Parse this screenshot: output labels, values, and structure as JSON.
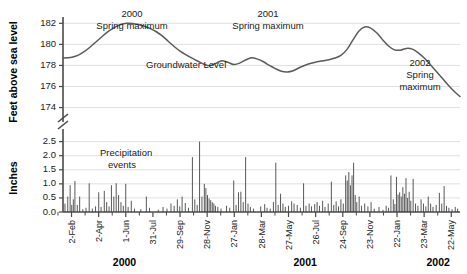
{
  "chart_data": {
    "type": "line",
    "title": "",
    "panels": [
      {
        "name": "groundwater",
        "type": "line",
        "ylabel": "Feet above sea level",
        "ylim": [
          173.2,
          182.6
        ],
        "yticks": [
          174,
          176,
          178,
          180,
          182
        ],
        "ytick_labels": [
          "174",
          "176",
          "178",
          "180",
          "182"
        ],
        "axis_break": true,
        "grid": true,
        "series_label": "Groundwater Level",
        "series": [
          {
            "name": "Groundwater Level",
            "color": "#5b5b5b",
            "x": [
              0,
              0.012,
              0.025,
              0.04,
              0.055,
              0.07,
              0.085,
              0.1,
              0.115,
              0.13,
              0.145,
              0.16,
              0.175,
              0.19,
              0.205,
              0.22,
              0.235,
              0.25,
              0.265,
              0.28,
              0.295,
              0.31,
              0.325,
              0.34,
              0.355,
              0.37,
              0.385,
              0.4,
              0.415,
              0.43,
              0.445,
              0.46,
              0.475,
              0.49,
              0.505,
              0.52,
              0.535,
              0.55,
              0.565,
              0.58,
              0.595,
              0.61,
              0.625,
              0.64,
              0.655,
              0.67,
              0.685,
              0.7,
              0.715,
              0.73,
              0.745,
              0.76,
              0.775,
              0.79,
              0.805,
              0.82,
              0.835,
              0.85,
              0.865,
              0.88,
              0.895,
              0.91,
              0.925,
              0.94,
              0.955,
              0.97,
              0.985,
              1.0
            ],
            "y": [
              178.7,
              178.72,
              178.8,
              179.0,
              179.35,
              179.8,
              180.3,
              180.8,
              181.25,
              181.62,
              181.88,
              182.0,
              181.98,
              181.88,
              181.72,
              181.5,
              181.2,
              180.8,
              180.3,
              179.8,
              179.35,
              179.0,
              178.7,
              178.4,
              178.12,
              177.98,
              178.2,
              178.45,
              178.3,
              178.1,
              178.22,
              178.52,
              178.72,
              178.6,
              178.35,
              178.0,
              177.7,
              177.45,
              177.38,
              177.5,
              177.78,
              178.02,
              178.2,
              178.35,
              178.45,
              178.55,
              178.7,
              178.95,
              179.5,
              180.4,
              181.25,
              181.65,
              181.55,
              181.1,
              180.45,
              179.85,
              179.48,
              179.45,
              179.62,
              179.55,
              179.2,
              178.7,
              178.1,
              177.45,
              176.8,
              176.15,
              175.55,
              175.05
            ]
          }
        ],
        "annotations": [
          {
            "text_lines": [
              "2000",
              "Spring maximum"
            ],
            "x": 0.155,
            "note": "2000 Spring maximum"
          },
          {
            "text_lines": [
              "2001",
              "Spring maximum"
            ],
            "x": 0.555,
            "note": "2001 Spring maximum"
          },
          {
            "text_lines": [
              "2002",
              "Spring",
              "maximum"
            ],
            "x": 0.895,
            "note": "2002 Spring maximum"
          }
        ]
      },
      {
        "name": "precipitation",
        "type": "bar",
        "ylabel": "Inches",
        "ylim": [
          0,
          2.7
        ],
        "yticks": [
          0.0,
          0.5,
          1.0,
          1.5,
          2.0,
          2.5
        ],
        "ytick_labels": [
          "0.0",
          "0.5",
          "1.0",
          "1.5",
          "2.0",
          "2.5"
        ],
        "grid": true,
        "series_label": "Precipitation events",
        "bar_color": "#3a3a3a",
        "values": [
          [
            0.005,
            0.3
          ],
          [
            0.012,
            0.55
          ],
          [
            0.018,
            0.95
          ],
          [
            0.022,
            0.25
          ],
          [
            0.026,
            0.45
          ],
          [
            0.03,
            1.1
          ],
          [
            0.036,
            0.25
          ],
          [
            0.042,
            0.55
          ],
          [
            0.05,
            0.1
          ],
          [
            0.058,
            0.15
          ],
          [
            0.066,
            1.02
          ],
          [
            0.074,
            0.12
          ],
          [
            0.082,
            0.2
          ],
          [
            0.09,
            0.7
          ],
          [
            0.096,
            0.18
          ],
          [
            0.104,
            0.75
          ],
          [
            0.11,
            0.35
          ],
          [
            0.116,
            0.2
          ],
          [
            0.122,
            0.95
          ],
          [
            0.128,
            0.55
          ],
          [
            0.134,
            1.02
          ],
          [
            0.14,
            0.6
          ],
          [
            0.146,
            0.35
          ],
          [
            0.152,
            0.22
          ],
          [
            0.158,
            1.0
          ],
          [
            0.164,
            0.18
          ],
          [
            0.172,
            0.4
          ],
          [
            0.18,
            0.12
          ],
          [
            0.196,
            0.1
          ],
          [
            0.21,
            0.55
          ],
          [
            0.218,
            0.15
          ],
          [
            0.24,
            0.08
          ],
          [
            0.252,
            0.18
          ],
          [
            0.262,
            0.12
          ],
          [
            0.272,
            0.3
          ],
          [
            0.28,
            0.22
          ],
          [
            0.288,
            0.45
          ],
          [
            0.294,
            0.2
          ],
          [
            0.3,
            0.55
          ],
          [
            0.308,
            0.32
          ],
          [
            0.316,
            0.15
          ],
          [
            0.326,
            1.95
          ],
          [
            0.332,
            0.45
          ],
          [
            0.338,
            0.25
          ],
          [
            0.344,
            2.5
          ],
          [
            0.35,
            0.55
          ],
          [
            0.356,
            1.0
          ],
          [
            0.36,
            0.85
          ],
          [
            0.364,
            0.6
          ],
          [
            0.368,
            0.48
          ],
          [
            0.372,
            0.42
          ],
          [
            0.376,
            0.35
          ],
          [
            0.38,
            0.3
          ],
          [
            0.384,
            0.22
          ],
          [
            0.39,
            0.18
          ],
          [
            0.398,
            0.12
          ],
          [
            0.412,
            0.22
          ],
          [
            0.42,
            0.15
          ],
          [
            0.43,
            1.12
          ],
          [
            0.436,
            0.25
          ],
          [
            0.442,
            0.7
          ],
          [
            0.448,
            0.72
          ],
          [
            0.454,
            0.35
          ],
          [
            0.46,
            1.95
          ],
          [
            0.466,
            0.3
          ],
          [
            0.472,
            0.18
          ],
          [
            0.48,
            0.12
          ],
          [
            0.498,
            0.2
          ],
          [
            0.508,
            0.28
          ],
          [
            0.514,
            0.15
          ],
          [
            0.522,
            0.12
          ],
          [
            0.53,
            0.35
          ],
          [
            0.536,
            1.75
          ],
          [
            0.542,
            0.25
          ],
          [
            0.548,
            0.65
          ],
          [
            0.554,
            0.3
          ],
          [
            0.56,
            0.18
          ],
          [
            0.568,
            0.22
          ],
          [
            0.576,
            0.38
          ],
          [
            0.582,
            0.3
          ],
          [
            0.59,
            0.25
          ],
          [
            0.598,
            0.15
          ],
          [
            0.606,
            1.02
          ],
          [
            0.612,
            0.22
          ],
          [
            0.62,
            0.3
          ],
          [
            0.626,
            0.2
          ],
          [
            0.634,
            0.28
          ],
          [
            0.64,
            0.35
          ],
          [
            0.646,
            0.22
          ],
          [
            0.654,
            0.4
          ],
          [
            0.66,
            0.18
          ],
          [
            0.668,
            0.3
          ],
          [
            0.676,
            1.08
          ],
          [
            0.682,
            0.25
          ],
          [
            0.688,
            0.38
          ],
          [
            0.694,
            0.2
          ],
          [
            0.7,
            0.45
          ],
          [
            0.706,
            0.3
          ],
          [
            0.712,
            1.3
          ],
          [
            0.716,
            1.12
          ],
          [
            0.72,
            1.42
          ],
          [
            0.724,
            0.95
          ],
          [
            0.728,
            1.3
          ],
          [
            0.732,
            1.75
          ],
          [
            0.736,
            0.6
          ],
          [
            0.74,
            0.35
          ],
          [
            0.746,
            0.55
          ],
          [
            0.752,
            0.22
          ],
          [
            0.76,
            0.3
          ],
          [
            0.768,
            0.2
          ],
          [
            0.776,
            0.35
          ],
          [
            0.784,
            0.12
          ],
          [
            0.796,
            0.18
          ],
          [
            0.806,
            0.08
          ],
          [
            0.814,
            0.22
          ],
          [
            0.82,
            0.15
          ],
          [
            0.826,
            1.3
          ],
          [
            0.832,
            0.45
          ],
          [
            0.836,
            0.28
          ],
          [
            0.84,
            1.25
          ],
          [
            0.844,
            0.62
          ],
          [
            0.848,
            0.7
          ],
          [
            0.852,
            0.55
          ],
          [
            0.856,
            0.88
          ],
          [
            0.86,
            0.65
          ],
          [
            0.864,
            1.2
          ],
          [
            0.868,
            0.5
          ],
          [
            0.872,
            0.72
          ],
          [
            0.876,
            0.4
          ],
          [
            0.882,
            1.18
          ],
          [
            0.888,
            0.3
          ],
          [
            0.894,
            0.22
          ],
          [
            0.902,
            0.45
          ],
          [
            0.908,
            0.3
          ],
          [
            0.914,
            0.2
          ],
          [
            0.92,
            0.55
          ],
          [
            0.926,
            0.3
          ],
          [
            0.932,
            0.18
          ],
          [
            0.94,
            0.25
          ],
          [
            0.948,
            0.68
          ],
          [
            0.954,
            0.3
          ],
          [
            0.96,
            0.92
          ],
          [
            0.966,
            0.22
          ],
          [
            0.972,
            0.15
          ],
          [
            0.98,
            0.1
          ],
          [
            0.988,
            0.18
          ],
          [
            0.994,
            0.12
          ]
        ]
      }
    ],
    "xaxis": {
      "tick_labels": [
        "2-Feb",
        "2-Apr",
        "1-Jun",
        "31-Jul",
        "29-Sep",
        "28-Nov",
        "27-Jan",
        "28-Mar",
        "27-May",
        "26-Jul",
        "24-Sep",
        "23-Nov",
        "22-Jan",
        "23-Mar",
        "22-May"
      ],
      "minor_ticks_between": 1,
      "year_labels": [
        {
          "label": "2000",
          "x": 0.155
        },
        {
          "label": "2001",
          "x": 0.61
        },
        {
          "label": "2002",
          "x": 0.945
        }
      ]
    }
  }
}
